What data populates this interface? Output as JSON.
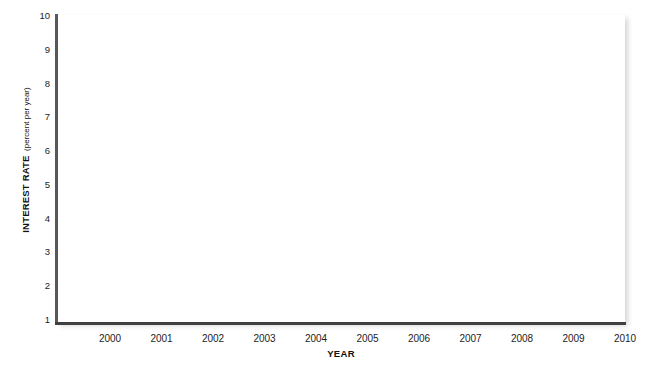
{
  "chart_data": {
    "type": "line",
    "title": "",
    "subtitle": "",
    "xlabel": "YEAR",
    "ylabel": "INTEREST RATE",
    "ylabel_units": "(percent per year)",
    "x": [
      2000,
      2001,
      2002,
      2003,
      2004,
      2005,
      2006,
      2007,
      2008,
      2009,
      2010
    ],
    "xtick_labels": [
      "2000",
      "2001",
      "2002",
      "2003",
      "2004",
      "2005",
      "2006",
      "2007",
      "2008",
      "2009",
      "2010"
    ],
    "ytick_labels": [
      "10",
      "9",
      "8",
      "7",
      "6",
      "5",
      "4",
      "3",
      "2",
      "1"
    ],
    "ytick_values": [
      10,
      9,
      8,
      7,
      6,
      5,
      4,
      3,
      2,
      1
    ],
    "xlim": [
      2000,
      2010
    ],
    "ylim": [
      1,
      10
    ],
    "grid": false,
    "legend": null,
    "legend_position": "none",
    "series": [],
    "annotations": [],
    "note": "Blank plotting grid — no data series are drawn in the plot area."
  },
  "colors": {
    "background": "#ffffff",
    "plot_background": "#ffffff",
    "y_axis_line": "#58585a",
    "x_axis_line": "#3f3f41",
    "tick_label": "#1d1d1d",
    "axis_title": "#111111"
  }
}
